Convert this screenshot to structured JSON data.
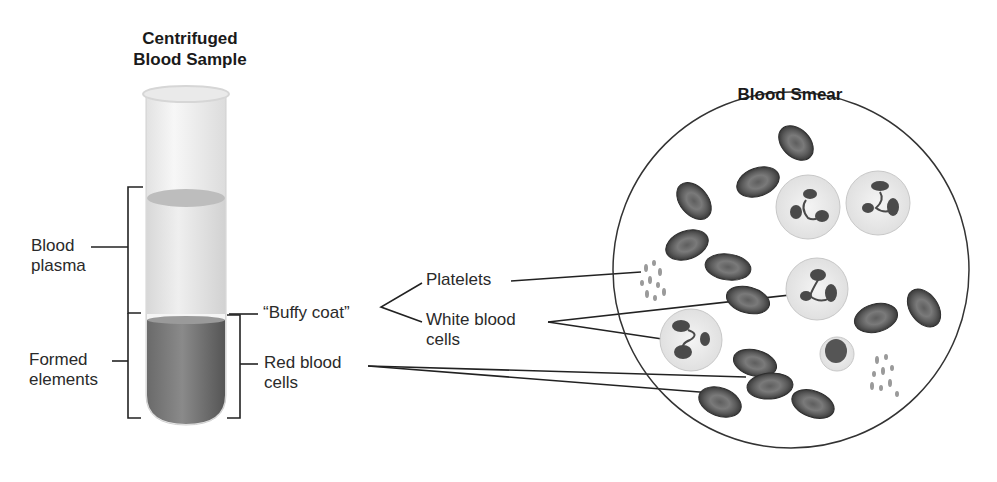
{
  "titles": {
    "tube_line1": "Centrifuged",
    "tube_line2": "Blood Sample",
    "smear": "Blood Smear"
  },
  "left_labels": {
    "plasma_line1": "Blood",
    "plasma_line2": "plasma",
    "formed_line1": "Formed",
    "formed_line2": "elements"
  },
  "middle_labels": {
    "buffy_coat": "“Buffy coat”",
    "rbc_line1": "Red blood",
    "rbc_line2": "cells"
  },
  "right_labels": {
    "platelets": "Platelets",
    "wbc_line1": "White blood",
    "wbc_line2": "cells"
  },
  "colors": {
    "plasma": "#e9e9e9",
    "red_cells": "#5a5a5a",
    "rbc_fill": "#4d4d4d",
    "wbc_fill": "#eeeeee",
    "line": "#222222"
  }
}
